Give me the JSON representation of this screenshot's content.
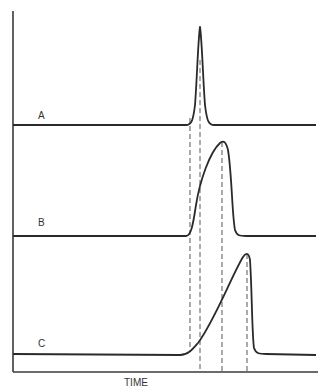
{
  "figure": {
    "x_axis_label": "TIME",
    "traces": [
      {
        "label": "A",
        "shape": "narrow symmetric peak"
      },
      {
        "label": "B",
        "shape": "broadened peak, gradual rise, sharp fall"
      },
      {
        "label": "C",
        "shape": "wide ramp rise, sharp fall"
      }
    ],
    "dashed_markers": 4,
    "colors": {
      "line": "#2a2a2a",
      "background": "#ffffff"
    }
  }
}
